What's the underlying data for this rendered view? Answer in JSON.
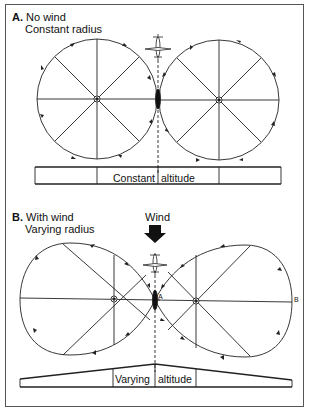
{
  "panel_a": {
    "letter": "A.",
    "title_line1": "No wind",
    "title_line2": "Constant radius",
    "altitude_label_left": "Constant",
    "altitude_label_right": "altitude"
  },
  "panel_b": {
    "letter": "B.",
    "title_line1": "With wind",
    "title_line2": "Varying radius",
    "wind_label": "Wind",
    "point_a": "A",
    "point_b": "B",
    "altitude_label_left": "Varying",
    "altitude_label_right": "altitude"
  },
  "colors": {
    "line": "#222222",
    "frame": "#555555"
  }
}
